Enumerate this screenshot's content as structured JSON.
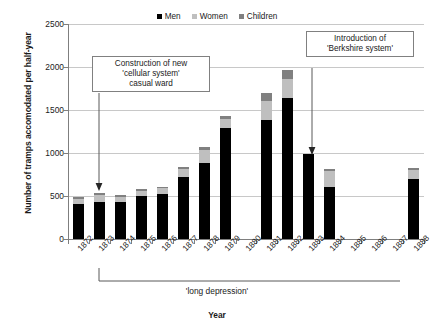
{
  "chart_data": {
    "type": "bar",
    "subtype": "stacked",
    "title": "",
    "xlabel": "Year",
    "ylabel": "Number of tramps accomodated per half-year",
    "ylim": [
      0,
      2500
    ],
    "yticks": [
      0,
      500,
      1000,
      1500,
      2000,
      2500
    ],
    "grid": true,
    "legend_position": "top-center",
    "categories": [
      "1872",
      "1873",
      "1874",
      "1875",
      "1876",
      "1877",
      "1878",
      "1879",
      "1880",
      "1881",
      "1882",
      "1883",
      "1884",
      "1885",
      "1886",
      "1887",
      "1888"
    ],
    "series": [
      {
        "name": "Men",
        "color": "#000000",
        "values": [
          410,
          435,
          425,
          505,
          525,
          720,
          885,
          1290,
          null,
          1380,
          1645,
          985,
          605,
          null,
          null,
          null,
          700
        ]
      },
      {
        "name": "Women",
        "color": "#bfbfbf",
        "values": [
          60,
          80,
          65,
          55,
          65,
          95,
          145,
          110,
          null,
          220,
          215,
          0,
          185,
          null,
          null,
          null,
          105
        ]
      },
      {
        "name": "Children",
        "color": "#808080",
        "values": [
          20,
          25,
          20,
          20,
          20,
          25,
          35,
          25,
          null,
          95,
          100,
          0,
          30,
          null,
          null,
          null,
          25
        ]
      }
    ],
    "totals": [
      490,
      540,
      510,
      580,
      610,
      840,
      1065,
      1425,
      null,
      1695,
      1960,
      985,
      820,
      null,
      null,
      null,
      830
    ],
    "annotations": [
      {
        "name": "cellular-system",
        "text": "Construction of new 'cellular system' casual ward",
        "points_to_category": "1873"
      },
      {
        "name": "berkshire-system",
        "text": "Introduction of 'Berkshire system'",
        "points_to_category": "1883"
      },
      {
        "name": "long-depression",
        "text": "'long depression'",
        "spans_categories": [
          "1873",
          "1888"
        ]
      }
    ]
  },
  "legend": {
    "items": [
      {
        "label": "Men",
        "color": "#000000"
      },
      {
        "label": "Women",
        "color": "#bfbfbf"
      },
      {
        "label": "Children",
        "color": "#808080"
      }
    ]
  },
  "axes": {
    "y_title": "Number of tramps accomodated per half-year",
    "x_title": "Year",
    "y_ticks": [
      "2500",
      "2000",
      "1500",
      "1000",
      "500",
      "0"
    ],
    "x_ticks": [
      "1872",
      "1873",
      "1874",
      "1875",
      "1876",
      "1877",
      "1878",
      "1879",
      "1880",
      "1881",
      "1882",
      "1883",
      "1884",
      "1885",
      "1886",
      "1887",
      "1888"
    ]
  },
  "callouts": {
    "cellular": {
      "line1": "Construction of new",
      "line2": "'cellular system'",
      "line3": "casual ward"
    },
    "berkshire": {
      "line1": "Introduction of",
      "line2": "'Berkshire system'"
    }
  },
  "era": {
    "label": "'long depression'"
  }
}
